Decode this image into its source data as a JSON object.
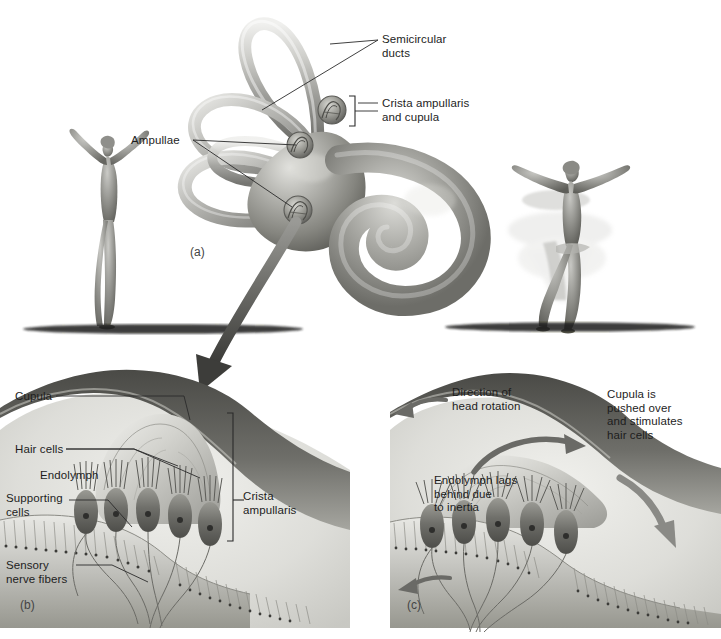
{
  "figure": {
    "background_color": "#ffffff",
    "text_color": "#1d1d1d"
  },
  "panels": [
    {
      "id": "a",
      "letter": "(a)",
      "x": 190,
      "y": 245
    },
    {
      "id": "b",
      "letter": "(b)",
      "x": 20,
      "y": 598
    },
    {
      "id": "c",
      "letter": "(c)",
      "x": 407,
      "y": 598
    }
  ],
  "panel_a": {
    "labels": [
      {
        "name": "semicircular-ducts",
        "text": "Semicircular\nducts",
        "x": 382,
        "y": 36
      },
      {
        "name": "crista-ampullaris-and-cupula",
        "text": "Crista ampullaris\nand cupula",
        "x": 382,
        "y": 99
      },
      {
        "name": "ampullae",
        "text": "Ampullae",
        "x": 131,
        "y": 137
      }
    ],
    "dancers": [
      {
        "name": "dancer-still",
        "pose": "standing-still-arms-raised"
      },
      {
        "name": "dancer-spinning",
        "pose": "spinning-with-motion-blur"
      }
    ],
    "structures": [
      "semicircular-ducts",
      "ampullae",
      "vestibule",
      "cochlea-spiral",
      "crista-ampullaris-inset"
    ]
  },
  "panel_b": {
    "labels": [
      {
        "name": "cupula",
        "text": "Cupula",
        "x": 15,
        "y": 392
      },
      {
        "name": "hair-cells",
        "text": "Hair cells",
        "x": 15,
        "y": 445
      },
      {
        "name": "endolymph",
        "text": "Endolymph",
        "x": 40,
        "y": 471
      },
      {
        "name": "supporting-cells",
        "text": "Supporting\ncells",
        "x": 6,
        "y": 494
      },
      {
        "name": "sensory-nerve-fibers",
        "text": "Sensory\nnerve fibers",
        "x": 6,
        "y": 561
      },
      {
        "name": "crista-ampullaris",
        "text": "Crista\nampullaris",
        "x": 243,
        "y": 492
      }
    ]
  },
  "panel_c": {
    "labels": [
      {
        "name": "direction-of-head-rotation",
        "text": "Direction of\nhead rotation",
        "x": 452,
        "y": 388
      },
      {
        "name": "cupula-pushed-over",
        "text": "Cupula is\npushed over\nand stimulates\nhair cells",
        "x": 607,
        "y": 390
      },
      {
        "name": "endolymph-lags",
        "text": "Endolymph lags\nbehind due\nto inertia",
        "x": 434,
        "y": 476
      }
    ],
    "arrows": [
      {
        "name": "head-rotation-arrow",
        "direction": "left"
      },
      {
        "name": "endolymph-flow-arrow",
        "direction": "left"
      },
      {
        "name": "cupula-deflection-arrow-top",
        "direction": "right-curved"
      },
      {
        "name": "cupula-deflection-arrow-side",
        "direction": "down-right-curved"
      }
    ]
  },
  "transition": {
    "name": "magnification-arrow",
    "description": "large curved arrow from ampulla to panel b"
  }
}
